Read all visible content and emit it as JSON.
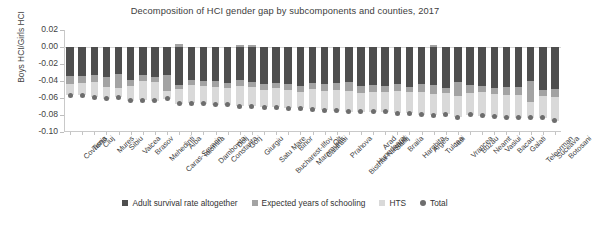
{
  "chart_data": {
    "type": "bar",
    "title": "Decomposition of HCI gender gap by subcomponents and counties, 2017",
    "xlabel": "",
    "ylabel": "Boys HCI/Girls HCI",
    "ylim": [
      -0.1,
      0.02
    ],
    "yticks": [
      "0.02",
      "0.00",
      "-0.02",
      "-0.04",
      "-0.06",
      "-0.08",
      "-0.10"
    ],
    "ytick_values": [
      0.02,
      0.0,
      -0.02,
      -0.04,
      -0.06,
      -0.08,
      -0.1
    ],
    "grid": false,
    "stacked": true,
    "legend_position": "bottom",
    "categories": [
      "Covasna",
      "Timis",
      "Cluj",
      "Mures",
      "Sibiu",
      "Valcea",
      "Brasov",
      "Mehedinti",
      "Caras-Severin",
      "Alba",
      "Ialomita",
      "Dambovita",
      "Constanta",
      "Dolj",
      "Gorj",
      "Giurgiu",
      "Satu Mare",
      "Bucharest-Ilfov",
      "Bihor",
      "Maramures",
      "Calarasi",
      "Olt",
      "Prahova",
      "Bistrita-Nasaud",
      "Hunedoara",
      "Arad",
      "Salaj",
      "Braila",
      "Harghita",
      "Arges",
      "Tulcea",
      "Iasi",
      "Vrancea",
      "Buzau",
      "Neamt",
      "Vaslui",
      "Bacau",
      "Galati",
      "Teleorman",
      "Suceava",
      "Botosani"
    ],
    "series": [
      {
        "name": "Adult survival rate altogether",
        "color": "#4e4e4e",
        "values": [
          -0.0345,
          -0.0345,
          -0.0325,
          -0.035,
          -0.032,
          -0.039,
          -0.033,
          -0.0355,
          -0.033,
          -0.045,
          -0.0385,
          -0.0395,
          -0.04,
          -0.042,
          -0.0385,
          -0.0415,
          -0.0435,
          -0.0425,
          -0.043,
          -0.0455,
          -0.042,
          -0.043,
          -0.0425,
          -0.041,
          -0.0455,
          -0.0445,
          -0.046,
          -0.0435,
          -0.0475,
          -0.044,
          -0.045,
          -0.048,
          -0.0415,
          -0.045,
          -0.046,
          -0.048,
          -0.047,
          -0.0475,
          -0.04,
          -0.05,
          -0.049
        ]
      },
      {
        "name": "Expected years of schooling",
        "color": "#a3a3a3",
        "values": [
          -0.0095,
          -0.0075,
          -0.0085,
          -0.012,
          -0.016,
          -0.0065,
          -0.0075,
          -0.006,
          -0.019,
          -0.0045,
          -0.006,
          -0.0065,
          -0.0065,
          -0.0065,
          -0.0075,
          -0.006,
          -0.007,
          -0.006,
          -0.0075,
          -0.007,
          -0.0075,
          -0.0085,
          -0.0075,
          -0.011,
          -0.009,
          -0.0085,
          -0.007,
          -0.0085,
          -0.006,
          -0.009,
          -0.0105,
          -0.006,
          -0.016,
          -0.009,
          -0.0075,
          -0.007,
          -0.01,
          -0.009,
          -0.025,
          -0.008,
          -0.0095
        ]
      },
      {
        "name": "HTS",
        "color": "#d9d9d9",
        "values": [
          -0.013,
          -0.015,
          -0.018,
          -0.014,
          -0.011,
          -0.0175,
          -0.022,
          -0.0215,
          -0.009,
          -0.0175,
          -0.0215,
          -0.021,
          -0.0215,
          -0.0195,
          -0.024,
          -0.022,
          -0.0205,
          -0.0225,
          -0.0215,
          -0.0195,
          -0.0235,
          -0.023,
          -0.025,
          -0.024,
          -0.0215,
          -0.023,
          -0.023,
          -0.026,
          -0.0245,
          -0.0265,
          -0.0245,
          -0.025,
          -0.025,
          -0.0255,
          -0.0275,
          -0.027,
          -0.026,
          -0.0265,
          -0.0185,
          -0.025,
          -0.0285
        ]
      },
      {
        "name": "positive-overshoot",
        "color": "#a3a3a3",
        "values": [
          0,
          0,
          0,
          0,
          0,
          0,
          0,
          0,
          0,
          0.0035,
          0,
          0,
          0,
          0,
          0.002,
          0.002,
          0,
          0,
          0,
          0,
          0,
          0,
          0,
          0,
          0,
          0,
          0,
          0,
          0,
          0,
          0.002,
          0,
          0,
          0,
          0,
          0,
          0,
          0,
          0,
          0,
          0
        ]
      }
    ],
    "total_marker": {
      "name": "Total",
      "color": "#6d6d6d",
      "values": [
        -0.057,
        -0.057,
        -0.059,
        -0.061,
        -0.059,
        -0.063,
        -0.0625,
        -0.063,
        -0.061,
        -0.067,
        -0.066,
        -0.067,
        -0.068,
        -0.068,
        -0.07,
        -0.0695,
        -0.071,
        -0.071,
        -0.072,
        -0.072,
        -0.073,
        -0.0745,
        -0.075,
        -0.076,
        -0.076,
        -0.076,
        -0.076,
        -0.078,
        -0.078,
        -0.0795,
        -0.08,
        -0.079,
        -0.0825,
        -0.0795,
        -0.081,
        -0.082,
        -0.083,
        -0.083,
        -0.0835,
        -0.083,
        -0.087
      ]
    },
    "legend": [
      {
        "label": "Adult survival rate altogether",
        "color": "#4e4e4e",
        "shape": "square"
      },
      {
        "label": "Expected years of schooling",
        "color": "#a3a3a3",
        "shape": "square"
      },
      {
        "label": "HTS",
        "color": "#d9d9d9",
        "shape": "square"
      },
      {
        "label": "Total",
        "color": "#6d6d6d",
        "shape": "circle"
      }
    ]
  }
}
